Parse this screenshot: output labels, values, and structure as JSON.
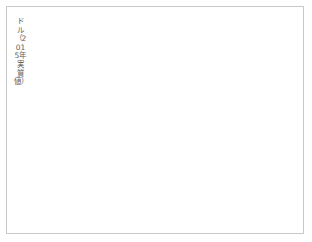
{
  "chart_data": {
    "type": "line",
    "title": "",
    "subtitle": "",
    "xlabel": "年",
    "ylabel": "ドル（2015年実質値）",
    "ylabel_chars": "ドル（2015年実質値）",
    "xlim": [
      1958,
      2022
    ],
    "ylim": [
      0,
      1600
    ],
    "y_ticks": [
      0,
      200,
      400,
      600,
      800,
      1000,
      1200,
      1400,
      1600
    ],
    "y_tick_labels": [
      "0",
      "200",
      "400",
      "600",
      "800",
      "1000",
      "1200",
      "1400",
      "1600"
    ],
    "x_ticks": [
      1960,
      1970,
      1980,
      1990,
      2000,
      2010,
      2020
    ],
    "x_tick_labels": [
      "1960",
      "1970",
      "1980",
      "1990",
      "2000",
      "2010",
      "2020"
    ],
    "grid": "horizontal",
    "legend": "none",
    "line_color": "#5a5a5a",
    "grid_color": "#e8e8e8",
    "background_color": "#ffffff",
    "frame_color": "#c9c9c9",
    "series": [
      {
        "name": "実質値",
        "x": [
          1960,
          1961,
          1962,
          1963,
          1964,
          1965,
          1966,
          1967,
          1968,
          1969,
          1970,
          1971,
          1972,
          1973,
          1974,
          1975,
          1976,
          1977,
          1978,
          1979,
          1980,
          1981,
          1982,
          1983,
          1984,
          1985,
          1986,
          1987,
          1988,
          1989,
          1990,
          1991,
          1992,
          1993,
          1994,
          1995,
          1996,
          1997,
          1998,
          1999,
          2000,
          2001,
          2002,
          2003,
          2004,
          2005,
          2006,
          2007,
          2008,
          2009,
          2010,
          2011,
          2012,
          2013,
          2014,
          2015,
          2016,
          2017,
          2018,
          2019,
          2020
        ],
        "values": [
          1200,
          1080,
          1235,
          1305,
          1300,
          1245,
          1275,
          1230,
          1290,
          1250,
          1305,
          1275,
          1315,
          1360,
          1340,
          1225,
          1150,
          1090,
          1035,
          1010,
          1000,
          975,
          960,
          955,
          975,
          965,
          985,
          960,
          940,
          900,
          840,
          690,
          560,
          490,
          470,
          450,
          430,
          410,
          385,
          345,
          325,
          335,
          350,
          360,
          370,
          380,
          395,
          410,
          425,
          440,
          455,
          465,
          475,
          485,
          490,
          485,
          495,
          500,
          510,
          520,
          530
        ]
      }
    ]
  },
  "axis": {
    "x_unit_label": "年",
    "origin_label": "0"
  }
}
